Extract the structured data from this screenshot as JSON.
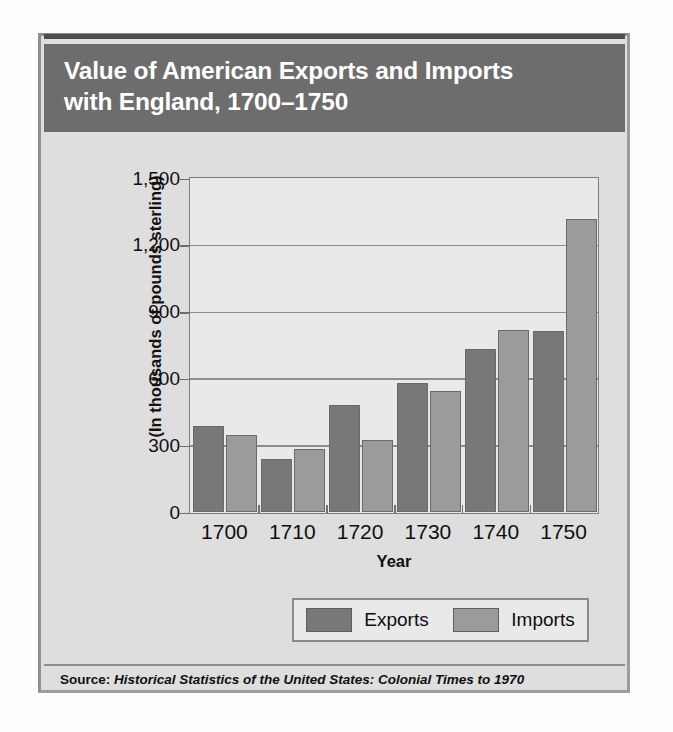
{
  "card": {
    "title": "Value of American Exports and Imports\nwith England, 1700–1750",
    "source_label": "Source:",
    "source_title": "Historical Statistics of the United States: Colonial Times to 1970"
  },
  "colors": {
    "banner": "#6d6d6d",
    "card_background": "#dedede",
    "plot_background": "#e9e9e9",
    "exports": "#787878",
    "imports": "#9b9b9b",
    "gridline": "#8c8c8c"
  },
  "chart_data": {
    "type": "bar",
    "title": "Value of American Exports and Imports with England, 1700–1750",
    "xlabel": "Year",
    "ylabel": "(In thousands of pounds sterling)",
    "categories": [
      "1700",
      "1710",
      "1720",
      "1730",
      "1740",
      "1750"
    ],
    "series": [
      {
        "name": "Exports",
        "values": [
          385,
          235,
          480,
          575,
          730,
          810
        ]
      },
      {
        "name": "Imports",
        "values": [
          345,
          280,
          320,
          540,
          815,
          1315
        ]
      }
    ],
    "ylim": [
      0,
      1500
    ],
    "yticks": [
      0,
      300,
      600,
      900,
      1200,
      1500
    ],
    "ytick_labels": [
      "0",
      "300",
      "600",
      "900",
      "1,200",
      "1,500"
    ],
    "grid": true,
    "legend_position": "bottom"
  }
}
